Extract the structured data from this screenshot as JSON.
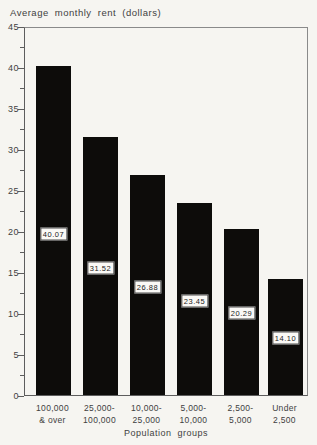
{
  "chart_data": {
    "type": "bar",
    "title": "Average monthly rent (dollars)",
    "xlabel": "Population groups",
    "ylabel": "",
    "categories": [
      "100,000 & over",
      "25,000-100,000",
      "10,000-25,000",
      "5,000-10,000",
      "2,500-5,000",
      "Under 2,500"
    ],
    "category_lines": [
      [
        "100,000",
        "& over"
      ],
      [
        "25,000-",
        "100,000"
      ],
      [
        "10,000-",
        "25,000"
      ],
      [
        "5,000-",
        "10,000"
      ],
      [
        "2,500-",
        "5,000"
      ],
      [
        "Under",
        "2,500"
      ]
    ],
    "values": [
      40.07,
      31.52,
      26.88,
      23.45,
      20.29,
      14.1
    ],
    "bar_value_labels": [
      "40.07",
      "31.52",
      "26.88",
      "23.45",
      "20.29",
      "14.10"
    ],
    "ylim": [
      0,
      45
    ],
    "ytick_interval": 5,
    "y_minor_tick_interval": 2.5,
    "ytick_labels": [
      "45",
      "40",
      "35",
      "30",
      "25",
      "20",
      "15",
      "10",
      "5",
      "0"
    ],
    "grid": false,
    "legend_position": "none",
    "bar_color": "#0d0c0a",
    "label_box_color": "#faf9f6",
    "paper_color": "#f6f5f1",
    "line_color": "#5d5d5d",
    "text_color": "#3f3f3f"
  }
}
